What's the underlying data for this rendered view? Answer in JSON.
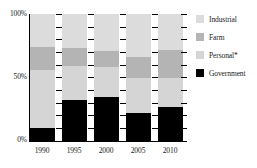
{
  "chart_data": {
    "type": "bar",
    "subtype": "stacked-percentage",
    "title": "",
    "xlabel": "",
    "ylabel": "",
    "categories": [
      "1990",
      "1995",
      "2000",
      "2005",
      "2010"
    ],
    "ylim": [
      0,
      100
    ],
    "y_tick_labels": [
      "0%",
      "50%",
      "100%"
    ],
    "y_major_ticks": [
      0,
      50,
      100
    ],
    "y_minor_ticks": [
      10,
      20,
      30,
      40,
      60,
      70,
      80,
      90
    ],
    "grid": false,
    "legend_position": "right",
    "series": [
      {
        "name": "Government",
        "color": "#000000",
        "values": [
          10,
          32,
          35,
          22,
          27
        ]
      },
      {
        "name": "Personal*",
        "color": "#d5d5d5",
        "values": [
          46,
          27,
          23,
          28,
          23
        ]
      },
      {
        "name": "Farm",
        "color": "#b4b4b4",
        "values": [
          18,
          14,
          13,
          16,
          22
        ]
      },
      {
        "name": "Industrial",
        "color": "#dcdcdc",
        "values": [
          26,
          27,
          29,
          34,
          28
        ]
      }
    ],
    "stack_order_bottom_to_top": [
      "Government",
      "Personal*",
      "Farm",
      "Industrial"
    ]
  },
  "legend": {
    "items": [
      {
        "label": "Industrial",
        "color": "#dcdcdc"
      },
      {
        "label": "Farm",
        "color": "#b4b4b4"
      },
      {
        "label": "Personal*",
        "color": "#d5d5d5"
      },
      {
        "label": "Government",
        "color": "#000000"
      }
    ]
  },
  "axes": {
    "y": {
      "top_label": "100%",
      "mid_label": "50%",
      "bottom_label": "0%"
    },
    "x": {
      "labels": [
        "1990",
        "1995",
        "2000",
        "2005",
        "2010"
      ]
    }
  },
  "colors": {
    "axis": "#000000",
    "background": "#ffffff",
    "text": "#1a1a1a"
  }
}
